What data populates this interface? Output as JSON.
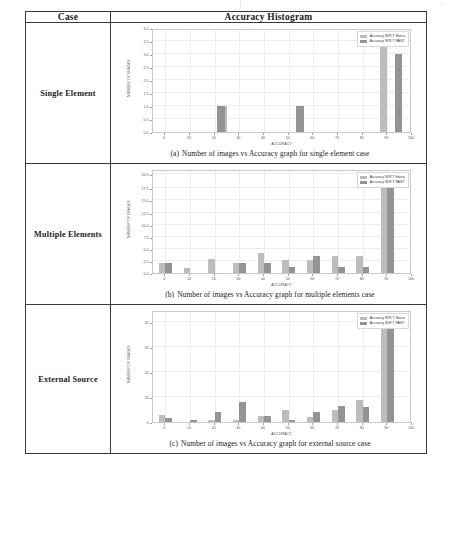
{
  "table": {
    "headers": [
      "Case",
      "Accuracy Histogram"
    ],
    "rows": [
      {
        "case": "Single Element",
        "caption_label": "(a)",
        "caption_text": "Number of images vs Accuracy graph for single element case"
      },
      {
        "case": "Multiple Elements",
        "caption_label": "(b)",
        "caption_text": "Number of images vs Accuracy graph for multiple elements case"
      },
      {
        "case": "External Source",
        "caption_label": "(c)",
        "caption_text": "Number of images vs Accuracy graph for external source case"
      }
    ]
  },
  "legend": {
    "harris": "Accuracy W.R.T Harris",
    "fast": "Accuracy W.R.T FAST"
  },
  "colors": {
    "harris": "#bdbdbd",
    "fast": "#949494",
    "grid": "#ededed",
    "axis": "#c9c9c9",
    "border": "#3a3a3a"
  },
  "chart_data": [
    {
      "type": "bar",
      "title": "",
      "xlabel": "ACCURACY",
      "ylabel": "NUMBER OF IMAGES",
      "xlim": [
        -5,
        100
      ],
      "ylim": [
        0,
        4.0
      ],
      "xticks": [
        0,
        10,
        20,
        30,
        40,
        50,
        60,
        70,
        80,
        90,
        100
      ],
      "yticks": [
        0.0,
        0.5,
        1.0,
        1.5,
        2.0,
        2.5,
        3.0,
        3.5,
        4.0
      ],
      "ytick_labels": [
        "0.0",
        "0.5",
        "1.0",
        "1.5",
        "2.0",
        "2.5",
        "3.0",
        "3.5",
        "4.0"
      ],
      "grid": true,
      "legend_position": "top-right",
      "series": [
        {
          "name": "Accuracy W.R.T Harris",
          "points": [
            {
              "x": 25,
              "y": 1.0
            },
            {
              "x": 90,
              "y": 3.6
            }
          ]
        },
        {
          "name": "Accuracy W.R.T FAST",
          "points": [
            {
              "x": 21,
              "y": 1.0
            },
            {
              "x": 53,
              "y": 1.0
            },
            {
              "x": 93,
              "y": 3.0
            }
          ]
        }
      ]
    },
    {
      "type": "bar",
      "title": "",
      "xlabel": "ACCURACY",
      "ylabel": "NUMBER OF IMAGES",
      "xlim": [
        -5,
        100
      ],
      "ylim": [
        0,
        21.5
      ],
      "xticks": [
        0,
        10,
        20,
        30,
        40,
        50,
        60,
        70,
        80,
        90,
        100
      ],
      "yticks": [
        0.0,
        2.5,
        5.0,
        7.5,
        10.0,
        12.5,
        15.0,
        17.5,
        20.5
      ],
      "ytick_labels": [
        "0.0",
        "2.5",
        "5.0",
        "7.5",
        "10.0",
        "12.5",
        "15.0",
        "17.5",
        "20.5"
      ],
      "grid": true,
      "legend_position": "top-right",
      "series": [
        {
          "name": "Accuracy W.R.T Harris",
          "points": [
            {
              "x": 0,
              "y": 2.0
            },
            {
              "x": 10,
              "y": 1.0
            },
            {
              "x": 20,
              "y": 3.0
            },
            {
              "x": 30,
              "y": 2.0
            },
            {
              "x": 40,
              "y": 4.2
            },
            {
              "x": 50,
              "y": 2.6
            },
            {
              "x": 60,
              "y": 2.6
            },
            {
              "x": 70,
              "y": 3.6
            },
            {
              "x": 80,
              "y": 3.6
            },
            {
              "x": 90,
              "y": 20.5
            }
          ]
        },
        {
          "name": "Accuracy W.R.T FAST",
          "points": [
            {
              "x": 0,
              "y": 2.0
            },
            {
              "x": 30,
              "y": 2.0
            },
            {
              "x": 40,
              "y": 2.0
            },
            {
              "x": 50,
              "y": 1.2
            },
            {
              "x": 60,
              "y": 3.6
            },
            {
              "x": 70,
              "y": 1.2
            },
            {
              "x": 80,
              "y": 1.2
            },
            {
              "x": 90,
              "y": 20.5
            }
          ]
        }
      ]
    },
    {
      "type": "bar",
      "title": "",
      "xlabel": "ACCURACY",
      "ylabel": "NUMBER OF IMAGES",
      "xlim": [
        -5,
        100
      ],
      "ylim": [
        0,
        45
      ],
      "xticks": [
        0,
        10,
        20,
        30,
        40,
        50,
        60,
        70,
        80,
        90,
        100
      ],
      "yticks": [
        0,
        10,
        20,
        30,
        40
      ],
      "ytick_labels": [
        "0",
        "10",
        "20",
        "30",
        "40"
      ],
      "grid": true,
      "legend_position": "top-right",
      "series": [
        {
          "name": "Accuracy W.R.T Harris",
          "points": [
            {
              "x": 0,
              "y": 3.0
            },
            {
              "x": 20,
              "y": 1.0
            },
            {
              "x": 30,
              "y": 1.0
            },
            {
              "x": 40,
              "y": 2.5
            },
            {
              "x": 50,
              "y": 5.0
            },
            {
              "x": 60,
              "y": 2.0
            },
            {
              "x": 70,
              "y": 5.0
            },
            {
              "x": 80,
              "y": 9.0
            },
            {
              "x": 90,
              "y": 43.0
            }
          ]
        },
        {
          "name": "Accuracy W.R.T FAST",
          "points": [
            {
              "x": 0,
              "y": 1.5
            },
            {
              "x": 10,
              "y": 1.0
            },
            {
              "x": 20,
              "y": 4.0
            },
            {
              "x": 30,
              "y": 8.0
            },
            {
              "x": 40,
              "y": 2.5
            },
            {
              "x": 50,
              "y": 1.0
            },
            {
              "x": 60,
              "y": 4.0
            },
            {
              "x": 70,
              "y": 6.5
            },
            {
              "x": 80,
              "y": 6.0
            },
            {
              "x": 90,
              "y": 41.0
            }
          ]
        }
      ]
    }
  ]
}
